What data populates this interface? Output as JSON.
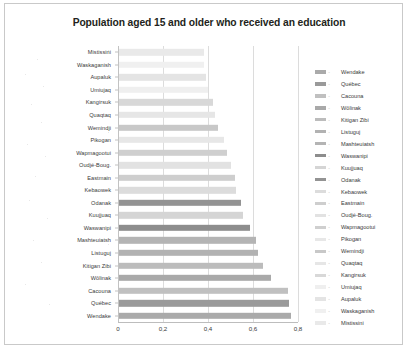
{
  "chart_data": {
    "type": "bar",
    "orientation": "horizontal",
    "title": "Population aged 15 and older who received an education",
    "xlabel": "",
    "ylabel": "",
    "xlim": [
      0,
      0.8
    ],
    "xticks": [
      0,
      0.2,
      0.4,
      0.6,
      0.8
    ],
    "xtick_labels": [
      "0",
      "0,2",
      "0,4",
      "0,6",
      "0,8"
    ],
    "grid": true,
    "legend_position": "right",
    "categories": [
      "Mistissini",
      "Waskaganish",
      "Aupaluk",
      "Umiujaq",
      "Kangirsuk",
      "Quaqtaq",
      "Wemindji",
      "Pikogan",
      "Wapmagootui",
      "Oudjé-Boug.",
      "Eastmain",
      "Kebaowek",
      "Odanak",
      "Kuujjuaq",
      "Waswanipi",
      "Mashteuiatsh",
      "Listuguj",
      "Kitigan Zibi",
      "Wôlinak",
      "Cacouna",
      "Québec",
      "Wendake"
    ],
    "values": [
      0.38,
      0.38,
      0.39,
      0.4,
      0.42,
      0.43,
      0.445,
      0.47,
      0.485,
      0.5,
      0.52,
      0.525,
      0.545,
      0.555,
      0.585,
      0.615,
      0.62,
      0.645,
      0.68,
      0.755,
      0.76,
      0.77
    ],
    "bar_colors": [
      "#e9e9e9",
      "#f0f0f0",
      "#e4e4e4",
      "#efefef",
      "#d8d8d8",
      "#e6e6e6",
      "#c8c8c8",
      "#e7e7e7",
      "#cfcfcf",
      "#e2e2e2",
      "#cecece",
      "#dcdcdc",
      "#939393",
      "#d5d5d5",
      "#8d8d8d",
      "#b4b4b4",
      "#b2b2b2",
      "#bcbcbc",
      "#a9a9a9",
      "#c0c0c0",
      "#9a9a9a",
      "#aaaaaa"
    ],
    "legend": [
      {
        "label": "Wendake",
        "color": "#aaaaaa"
      },
      {
        "label": "Québec",
        "color": "#9a9a9a"
      },
      {
        "label": "Cacouna",
        "color": "#c0c0c0"
      },
      {
        "label": "Wôlinak",
        "color": "#a9a9a9"
      },
      {
        "label": "Kitigan Zibi",
        "color": "#bcbcbc"
      },
      {
        "label": "Listuguj",
        "color": "#b2b2b2"
      },
      {
        "label": "Mashteuiatsh",
        "color": "#b4b4b4"
      },
      {
        "label": "Waswanipi",
        "color": "#8d8d8d"
      },
      {
        "label": "Kuujjuaq",
        "color": "#d5d5d5"
      },
      {
        "label": "Odanak",
        "color": "#939393"
      },
      {
        "label": "Kebaowek",
        "color": "#dcdcdc"
      },
      {
        "label": "Eastmain",
        "color": "#cecece"
      },
      {
        "label": "Oudjé-Boug.",
        "color": "#e2e2e2"
      },
      {
        "label": "Wapmagootui",
        "color": "#cfcfcf"
      },
      {
        "label": "Pikogan",
        "color": "#e7e7e7"
      },
      {
        "label": "Wemindji",
        "color": "#c8c8c8"
      },
      {
        "label": "Quaqtaq",
        "color": "#e6e6e6"
      },
      {
        "label": "Kangirsuk",
        "color": "#d8d8d8"
      },
      {
        "label": "Umiujaq",
        "color": "#efefef"
      },
      {
        "label": "Aupaluk",
        "color": "#e4e4e4"
      },
      {
        "label": "Waskaganish",
        "color": "#f0f0f0"
      },
      {
        "label": "Mistissini",
        "color": "#e9e9e9"
      }
    ]
  },
  "colors": {
    "title": "#231f20",
    "grid": "#dcdcdc",
    "axis": "#c2c2c2",
    "frame": "#c9c9c9",
    "background": "#ffffff",
    "text": "#3a3a3a"
  }
}
